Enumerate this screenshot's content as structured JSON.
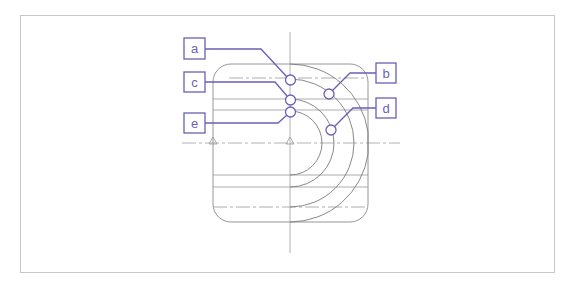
{
  "diagram": {
    "type": "technical-drawing",
    "colors": {
      "callout": "#6b5fb5",
      "drawing_line": "#8a8a8a",
      "frame": "#c8c8c8"
    },
    "callouts": [
      {
        "id": "a",
        "label": "a"
      },
      {
        "id": "b",
        "label": "b"
      },
      {
        "id": "c",
        "label": "c"
      },
      {
        "id": "d",
        "label": "d"
      },
      {
        "id": "e",
        "label": "e"
      }
    ]
  }
}
